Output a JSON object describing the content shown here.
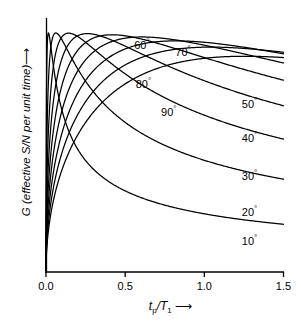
{
  "chart_data": {
    "type": "line",
    "title": "",
    "xlabel": "tp/T1",
    "xlabel_parts": {
      "base": "t",
      "sub": "p",
      "denom": "/T",
      "denom_sub": "1",
      "arrow": "⟶"
    },
    "ylabel": "G (effective S/N per unit time)",
    "ylabel_arrow": "⟶",
    "xlim": [
      0.0,
      1.5
    ],
    "ylim": [
      0.0,
      1.05
    ],
    "grid": false,
    "legend": "inline-curve-labels",
    "xticks": [
      "0.0",
      "0.5",
      "1.0",
      "1.5"
    ],
    "xtick_values": [
      0.0,
      0.5,
      1.0,
      1.5
    ],
    "yticks": [],
    "axis_color": "#000000",
    "curve_color": "#000000",
    "background": "#ffffff",
    "formula": "G = sin(a)*(1-E)/(1-E*cos(a))/sqrt(x), E = exp(-x)",
    "series": [
      {
        "name": "10°",
        "angle_deg": 10,
        "label": "10",
        "degree": "°",
        "label_x": 1.3,
        "label_y": 0.135,
        "peak_x": 0.015,
        "peak_y": 0.96,
        "end_y": 0.075
      },
      {
        "name": "20°",
        "angle_deg": 20,
        "label": "20",
        "degree": "°",
        "label_x": 1.3,
        "label_y": 0.255,
        "peak_x": 0.061,
        "peak_y": 0.97,
        "end_y": 0.185
      },
      {
        "name": "30°",
        "angle_deg": 30,
        "label": "30",
        "degree": "°",
        "label_x": 1.3,
        "label_y": 0.405,
        "peak_x": 0.139,
        "peak_y": 0.975,
        "end_y": 0.315
      },
      {
        "name": "40°",
        "angle_deg": 40,
        "label": "40",
        "degree": "°",
        "label_x": 1.3,
        "label_y": 0.565,
        "peak_x": 0.253,
        "peak_y": 0.98,
        "end_y": 0.455
      },
      {
        "name": "50°",
        "angle_deg": 50,
        "label": "50",
        "degree": "°",
        "label_x": 1.3,
        "label_y": 0.705,
        "peak_x": 0.409,
        "peak_y": 0.985,
        "end_y": 0.605
      },
      {
        "name": "60°",
        "angle_deg": 60,
        "label": "60",
        "degree": "°",
        "label_x": 0.62,
        "label_y": 0.955,
        "peak_x": 0.625,
        "peak_y": 0.99,
        "end_y": 0.745
      },
      {
        "name": "70°",
        "angle_deg": 70,
        "label": "70",
        "degree": "°",
        "label_x": 0.88,
        "label_y": 0.925,
        "peak_x": 0.935,
        "peak_y": 0.995,
        "end_y": 0.855
      },
      {
        "name": "80°",
        "angle_deg": 80,
        "label": "80",
        "degree": "°",
        "label_x": 0.63,
        "label_y": 0.79,
        "peak_x": 1.42,
        "peak_y": 1.0,
        "end_y": 0.925
      },
      {
        "name": "90°",
        "angle_deg": 90,
        "label": "90",
        "degree": "°",
        "label_x": 0.79,
        "label_y": 0.675,
        "peak_x": 1.49,
        "peak_y": 0.99,
        "end_y": 0.955
      }
    ]
  },
  "axes": {
    "x_axis_name": "tp-over-T1-axis",
    "y_axis_name": "G-axis"
  }
}
